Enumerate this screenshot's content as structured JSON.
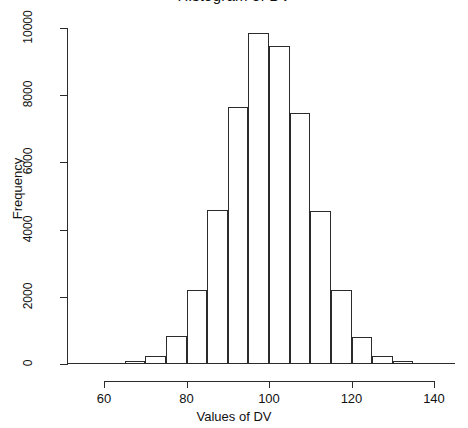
{
  "chart_data": {
    "type": "bar",
    "title": "Histogram of DV",
    "xlabel": "Values of DV",
    "ylabel": "Frequency",
    "xlim": [
      55,
      145
    ],
    "ylim": [
      0,
      10000
    ],
    "bin_width": 5,
    "grid": false,
    "legend": null,
    "xticks": [
      "60",
      "80",
      "100",
      "120",
      "140"
    ],
    "xtick_values": [
      60,
      80,
      100,
      120,
      140
    ],
    "yticks": [
      "0",
      "2000",
      "4000",
      "6000",
      "8000",
      "10000"
    ],
    "ytick_values": [
      0,
      2000,
      4000,
      6000,
      8000,
      10000
    ],
    "bins": [
      {
        "start": 55,
        "end": 60,
        "value": 10
      },
      {
        "start": 60,
        "end": 65,
        "value": 25
      },
      {
        "start": 65,
        "end": 70,
        "value": 100
      },
      {
        "start": 70,
        "end": 75,
        "value": 250
      },
      {
        "start": 75,
        "end": 80,
        "value": 820
      },
      {
        "start": 80,
        "end": 85,
        "value": 2200
      },
      {
        "start": 85,
        "end": 90,
        "value": 4580
      },
      {
        "start": 90,
        "end": 95,
        "value": 7650
      },
      {
        "start": 95,
        "end": 100,
        "value": 9850
      },
      {
        "start": 100,
        "end": 105,
        "value": 9450
      },
      {
        "start": 105,
        "end": 110,
        "value": 7480
      },
      {
        "start": 110,
        "end": 115,
        "value": 4560
      },
      {
        "start": 115,
        "end": 120,
        "value": 2200
      },
      {
        "start": 120,
        "end": 125,
        "value": 800
      },
      {
        "start": 125,
        "end": 130,
        "value": 250
      },
      {
        "start": 130,
        "end": 135,
        "value": 90
      },
      {
        "start": 135,
        "end": 140,
        "value": 25
      },
      {
        "start": 140,
        "end": 145,
        "value": 8
      }
    ],
    "categories": [
      "55-60",
      "60-65",
      "65-70",
      "70-75",
      "75-80",
      "80-85",
      "85-90",
      "90-95",
      "95-100",
      "100-105",
      "105-110",
      "110-115",
      "115-120",
      "120-125",
      "125-130",
      "130-135",
      "135-140",
      "140-145"
    ],
    "values": [
      10,
      25,
      100,
      250,
      820,
      2200,
      4580,
      7650,
      9850,
      9450,
      7480,
      4560,
      2200,
      800,
      250,
      90,
      25,
      8
    ]
  },
  "style": {
    "line_color": "#2b2b2b",
    "bar_fill": "transparent",
    "background": "#ffffff",
    "text_color": "#111111"
  }
}
